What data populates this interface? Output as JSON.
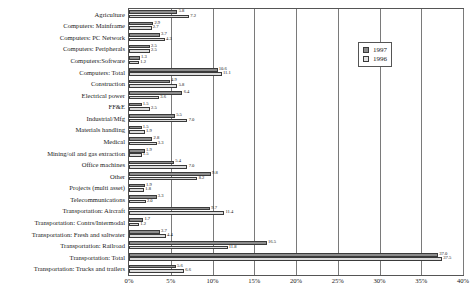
{
  "chart_data": {
    "type": "bar",
    "orientation": "horizontal",
    "title": "",
    "xlabel": "",
    "ylabel": "",
    "xlim": [
      0,
      40
    ],
    "xticks": [
      "0%",
      "5%",
      "10%",
      "15%",
      "20%",
      "25%",
      "30%",
      "35%",
      "40%"
    ],
    "xtick_values": [
      0,
      5,
      10,
      15,
      20,
      25,
      30,
      35,
      40
    ],
    "grid": true,
    "legend_position": "top-right",
    "categories": [
      "Agriculture",
      "Computers: Mainframe",
      "Computers: PC Network",
      "Computers: Peripherals",
      "Computers:Software",
      "Computers: Total",
      "Construction",
      "Electrical power",
      "FF&E",
      "Industrial/Mfg",
      "Materials handling",
      "Medical",
      "Mining/oil and gas extraction",
      "Office machines",
      "Other",
      "Projects (multi asset)",
      "Telecommunications",
      "Transportation: Aircraft",
      "Transportation: Contrs/Intermodal",
      "Transportation: Fresh and saltwater",
      "Transportation: Railroad",
      "Transportation: Total",
      "Transportation: Trucks and trailers"
    ],
    "series": [
      {
        "name": "1997",
        "color": "#8c8c8c",
        "values": [
          5.8,
          2.9,
          3.7,
          2.5,
          1.3,
          10.6,
          4.9,
          6.4,
          1.5,
          5.5,
          1.5,
          2.8,
          1.9,
          5.4,
          9.8,
          1.9,
          3.3,
          9.7,
          1.7,
          3.7,
          16.5,
          37.0,
          5.6
        ],
        "labels": [
          "5.8",
          "2.9",
          "3.7",
          "2.5",
          "1.3",
          "10.6",
          "4.9",
          "6.4",
          "1.5",
          "5.5",
          "1.5",
          "2.8",
          "1.9",
          "5.4",
          "9.8",
          "1.9",
          "3.3",
          "9.7",
          "1.7",
          "3.7",
          "16.5",
          "37.0",
          "5.6"
        ]
      },
      {
        "name": "1996",
        "color": "#dcdcdc",
        "values": [
          7.2,
          2.7,
          4.3,
          2.5,
          1.2,
          11.1,
          5.8,
          3.6,
          2.5,
          7.0,
          1.9,
          3.3,
          1.5,
          7.0,
          8.2,
          1.8,
          2.0,
          11.4,
          1.2,
          4.4,
          11.8,
          37.5,
          6.6
        ],
        "labels": [
          "7.2",
          "2.7",
          "4.3",
          "2.5",
          "1.2",
          "11.1",
          "5.8",
          "3.6",
          "2.5",
          "7.0",
          "1.9",
          "3.3",
          "1.5",
          "7.0",
          "8.2",
          "1.8",
          "2.0",
          "11.4",
          "1.2",
          "4.4",
          "11.8",
          "37.5",
          "6.6"
        ]
      }
    ]
  },
  "legend": {
    "entries": [
      {
        "label": "1997",
        "color": "#8c8c8c"
      },
      {
        "label": "1996",
        "color": "#e2e2e2"
      }
    ]
  }
}
